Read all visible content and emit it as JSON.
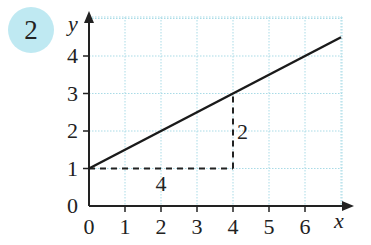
{
  "question_number": "2",
  "colors": {
    "badge": "#bfe9f2",
    "grid": "#a9dbe6",
    "line": "#1a1a1a"
  },
  "chart_data": {
    "type": "line",
    "title": "",
    "xlabel": "x",
    "ylabel": "y",
    "xlim": [
      0,
      7
    ],
    "ylim": [
      0,
      5
    ],
    "grid": true,
    "x_ticks": [
      "0",
      "1",
      "2",
      "3",
      "4",
      "5",
      "6"
    ],
    "y_ticks": [
      "0",
      "1",
      "2",
      "3",
      "4"
    ],
    "series": [
      {
        "name": "line",
        "x": [
          0,
          4,
          7
        ],
        "y": [
          1,
          3,
          4.5
        ]
      }
    ],
    "annotations": [
      {
        "type": "dashed-horizontal",
        "from": [
          0,
          1
        ],
        "to": [
          4,
          1
        ],
        "label": "4"
      },
      {
        "type": "dashed-vertical",
        "from": [
          4,
          1
        ],
        "to": [
          4,
          3
        ],
        "label": "2"
      }
    ]
  }
}
